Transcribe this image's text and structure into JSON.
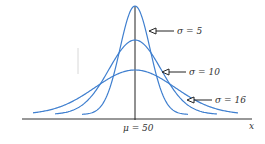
{
  "chart_data": {
    "type": "line",
    "title": "",
    "xlabel": "x",
    "ylabel": "",
    "mean_label": "μ = 50",
    "mean": 50,
    "grid": false,
    "series": [
      {
        "name": "σ = 5",
        "sigma": 5,
        "label": "σ = 5"
      },
      {
        "name": "σ = 10",
        "sigma": 10,
        "label": "σ = 10"
      },
      {
        "name": "σ = 16",
        "sigma": 16,
        "label": "σ = 16"
      }
    ],
    "curve_color": "#3f7fcf",
    "axis_color": "#222222"
  },
  "labels": {
    "s5": "σ = 5",
    "s10": "σ = 10",
    "s16": "σ = 16",
    "mu": "μ = 50",
    "x": "x"
  }
}
